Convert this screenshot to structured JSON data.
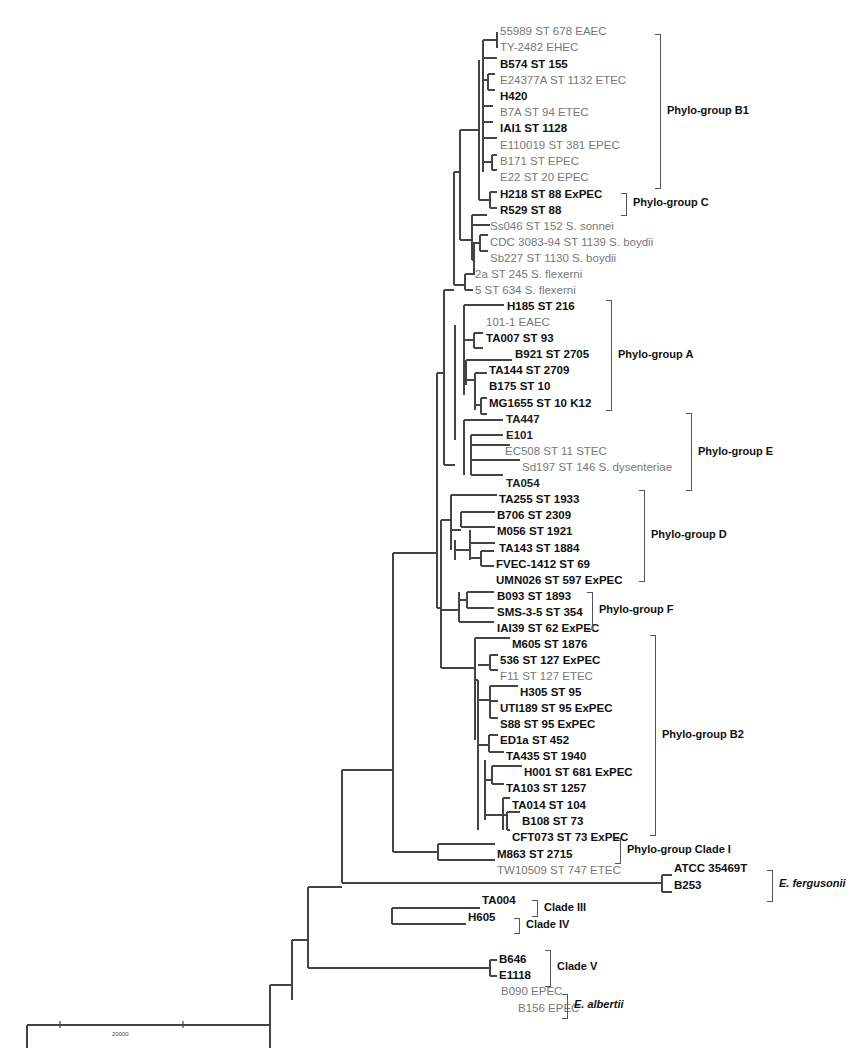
{
  "figure": {
    "type": "phylogenetic-tree",
    "scale_bar": {
      "label": "20000"
    },
    "leaves": [
      {
        "label": "55989 ST 678 EAEC",
        "style": "grey"
      },
      {
        "label": "TY-2482 EHEC",
        "style": "grey"
      },
      {
        "label": "B574 ST 155",
        "style": "bold"
      },
      {
        "label": "E24377A ST 1132 ETEC",
        "style": "grey"
      },
      {
        "label": "H420",
        "style": "bold"
      },
      {
        "label": "B7A ST 94 ETEC",
        "style": "grey"
      },
      {
        "label": "IAI1 ST 1128",
        "style": "bold"
      },
      {
        "label": "E110019 ST 381 EPEC",
        "style": "grey"
      },
      {
        "label": "B171 ST EPEC",
        "style": "grey"
      },
      {
        "label": "E22 ST 20 EPEC",
        "style": "grey"
      },
      {
        "label": "H218 ST 88 ExPEC",
        "style": "bold"
      },
      {
        "label": "R529 ST 88",
        "style": "bold"
      },
      {
        "label": "Ss046 ST 152 S. sonnei",
        "style": "grey"
      },
      {
        "label": "CDC 3083-94 ST 1139 S. boydii",
        "style": "grey"
      },
      {
        "label": "Sb227 ST 1130 S. boydii",
        "style": "grey"
      },
      {
        "label": "2a ST 245 S. flexerni",
        "style": "grey"
      },
      {
        "label": "5 ST 634 S. flexerni",
        "style": "grey"
      },
      {
        "label": "H185 ST 216",
        "style": "bold"
      },
      {
        "label": "101-1 EAEC",
        "style": "grey"
      },
      {
        "label": "TA007 ST 93",
        "style": "bold"
      },
      {
        "label": "B921 ST 2705",
        "style": "bold"
      },
      {
        "label": "TA144 ST 2709",
        "style": "bold"
      },
      {
        "label": "B175 ST 10",
        "style": "bold"
      },
      {
        "label": "MG1655 ST 10 K12",
        "style": "bold"
      },
      {
        "label": "TA447",
        "style": "boldgrey"
      },
      {
        "label": "E101",
        "style": "boldgrey"
      },
      {
        "label": "EC508 ST 11 STEC",
        "style": "grey"
      },
      {
        "label": "Sd197 ST 146 S. dysenteriae",
        "style": "grey"
      },
      {
        "label": "TA054",
        "style": "boldgrey"
      },
      {
        "label": "TA255 ST 1933",
        "style": "bold"
      },
      {
        "label": "B706 ST 2309",
        "style": "bold"
      },
      {
        "label": "M056 ST 1921",
        "style": "bold"
      },
      {
        "label": "TA143 ST 1884",
        "style": "bold"
      },
      {
        "label": "FVEC-1412 ST 69",
        "style": "bold"
      },
      {
        "label": "UMN026 ST 597 ExPEC",
        "style": "bold"
      },
      {
        "label": "B093 ST 1893",
        "style": "bold"
      },
      {
        "label": "SMS-3-5 ST 354",
        "style": "bold"
      },
      {
        "label": "IAI39 ST 62 ExPEC",
        "style": "bold"
      },
      {
        "label": "M605 ST 1876",
        "style": "bold"
      },
      {
        "label": "536 ST 127 ExPEC",
        "style": "bold"
      },
      {
        "label": "F11 ST 127 ETEC",
        "style": "grey"
      },
      {
        "label": "H305 ST 95",
        "style": "bold"
      },
      {
        "label": "UTI189 ST 95 ExPEC",
        "style": "bold"
      },
      {
        "label": "S88 ST 95 ExPEC",
        "style": "bold"
      },
      {
        "label": "ED1a ST 452",
        "style": "bold"
      },
      {
        "label": "TA435 ST 1940",
        "style": "bold"
      },
      {
        "label": "H001 ST 681 ExPEC",
        "style": "bold"
      },
      {
        "label": "TA103 ST 1257",
        "style": "bold"
      },
      {
        "label": "TA014 ST 104",
        "style": "bold"
      },
      {
        "label": "B108 ST 73",
        "style": "bold"
      },
      {
        "label": "CFT073 ST 73 ExPEC",
        "style": "bold"
      },
      {
        "label": "M863 ST 2715",
        "style": "bold"
      },
      {
        "label": "TW10509 ST 747 ETEC",
        "style": "grey"
      },
      {
        "label": "ATCC  35469T",
        "style": "bold"
      },
      {
        "label": "B253",
        "style": "bold"
      },
      {
        "label": "TA004",
        "style": "bold"
      },
      {
        "label": "H605",
        "style": "bold"
      },
      {
        "label": "B646",
        "style": "bold"
      },
      {
        "label": "E1118",
        "style": "bold"
      },
      {
        "label": "B090 EPEC",
        "style": "grey"
      },
      {
        "label": "B156 EPEC",
        "style": "grey"
      },
      {
        "label": "Salmonella enterica",
        "style": "bold"
      }
    ],
    "groups": [
      {
        "label": "Phylo-group B1",
        "italic": false
      },
      {
        "label": "Phylo-group C",
        "italic": false
      },
      {
        "label": "Phylo-group A",
        "italic": false
      },
      {
        "label": "Phylo-group E",
        "italic": false
      },
      {
        "label": "Phylo-group D",
        "italic": false
      },
      {
        "label": "Phylo-group F",
        "italic": false
      },
      {
        "label": "Phylo-group B2",
        "italic": false
      },
      {
        "label": "Phylo-group Clade I",
        "italic": false
      },
      {
        "label": "E. fergusonii",
        "italic": true
      },
      {
        "label": "Clade III",
        "italic": false
      },
      {
        "label": "Clade IV",
        "italic": false
      },
      {
        "label": "Clade V",
        "italic": false
      },
      {
        "label": "E. albertii",
        "italic": true
      }
    ]
  }
}
